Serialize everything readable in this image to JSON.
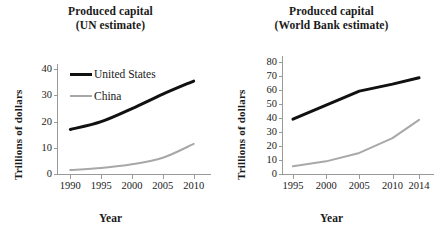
{
  "figure": {
    "ylabel": "Trillions of dollars",
    "xlabel": "Year",
    "series_names": [
      "United States",
      "China"
    ],
    "colors": {
      "united_states": "#111111",
      "china": "#a8a8a8",
      "axis": "#9a9a9a",
      "text": "#1a1a1a"
    }
  },
  "panels": [
    {
      "id": "un",
      "title_line1": "Produced capital",
      "title_line2": "(UN estimate)",
      "ylabel": "Trillions of dollars",
      "xlabel": "Year",
      "legend": [
        {
          "label": "United States",
          "color": "#111111"
        },
        {
          "label": "China",
          "color": "#a8a8a8"
        }
      ]
    },
    {
      "id": "worldbank",
      "title_line1": "Produced capital",
      "title_line2": "(World Bank estimate)",
      "ylabel": "Trillions of dollars",
      "xlabel": "Year",
      "legend": []
    }
  ],
  "chart_data": [
    {
      "type": "line",
      "title": "Produced capital (UN estimate)",
      "xlabel": "Year",
      "ylabel": "Trillions of dollars",
      "xlim": [
        1988,
        2012
      ],
      "ylim": [
        0,
        42
      ],
      "xticks": [
        1990,
        1995,
        2000,
        2005,
        2010
      ],
      "yticks": [
        0,
        10,
        20,
        30,
        40
      ],
      "grid": false,
      "legend_position": "upper-left",
      "x": [
        1990,
        1995,
        2000,
        2005,
        2010
      ],
      "series": [
        {
          "name": "United States",
          "color": "#111111",
          "values": [
            17.0,
            20.0,
            25.0,
            30.5,
            35.5
          ]
        },
        {
          "name": "China",
          "color": "#a8a8a8",
          "values": [
            1.5,
            2.3,
            3.7,
            6.2,
            11.5
          ]
        }
      ]
    },
    {
      "type": "line",
      "title": "Produced capital (World Bank estimate)",
      "xlabel": "Year",
      "ylabel": "Trillions of dollars",
      "xlim": [
        1993.5,
        2015.5
      ],
      "ylim": [
        0,
        84
      ],
      "xticks": [
        1995,
        2000,
        2005,
        2010,
        2014
      ],
      "yticks": [
        0,
        10,
        20,
        30,
        40,
        50,
        60,
        70,
        80
      ],
      "grid": false,
      "legend_position": "none",
      "x": [
        1995,
        2000,
        2005,
        2010,
        2014
      ],
      "series": [
        {
          "name": "United States",
          "color": "#111111",
          "values": [
            39.0,
            49.0,
            59.0,
            64.0,
            68.5
          ]
        },
        {
          "name": "China",
          "color": "#a8a8a8",
          "values": [
            5.5,
            9.0,
            15.0,
            25.5,
            38.5
          ]
        }
      ]
    }
  ]
}
